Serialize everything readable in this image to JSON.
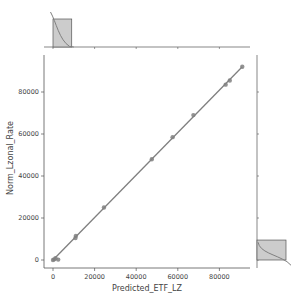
{
  "chart_data": {
    "type": "scatter",
    "subtype": "jointplot-regression",
    "title": "",
    "xlabel": "Predicted_ETF_LZ",
    "ylabel": "Norm_Lzonal_Rate",
    "xlim": [
      -4500,
      95000
    ],
    "ylim": [
      -4000,
      98000
    ],
    "xticks": [
      0,
      20000,
      40000,
      60000,
      80000
    ],
    "yticks": [
      0,
      20000,
      40000,
      60000,
      80000
    ],
    "xtick_labels": [
      "0",
      "20000",
      "40000",
      "60000",
      "80000"
    ],
    "ytick_labels": [
      "0",
      "20000",
      "40000",
      "60000",
      "80000"
    ],
    "grid": false,
    "legend": null,
    "series": [
      {
        "name": "points",
        "x": [
          0,
          600,
          1200,
          2500,
          11000,
          10800,
          24500,
          47500,
          57500,
          67500,
          83000,
          85000,
          91000
        ],
        "y": [
          0,
          300,
          800,
          200,
          11500,
          10500,
          25000,
          48000,
          58500,
          69000,
          83500,
          85500,
          92000
        ]
      }
    ],
    "regression_line": {
      "x": [
        0,
        91000
      ],
      "y": [
        0,
        92000
      ]
    },
    "marginal_top": {
      "type": "histogram+kde",
      "bins": [
        {
          "x0": 0,
          "x1": 9000,
          "height_rel": 1.0
        }
      ],
      "ticks": [
        0,
        20000,
        40000,
        60000,
        80000
      ]
    },
    "marginal_right": {
      "type": "histogram+kde",
      "bins": [
        {
          "y0": 0,
          "y1": 9500,
          "height_rel": 1.0
        }
      ]
    },
    "colors": {
      "points": "#808080",
      "line": "#808080",
      "hist_fill": "#cccccc",
      "hist_edge": "#555555",
      "axis": "#555555"
    }
  }
}
